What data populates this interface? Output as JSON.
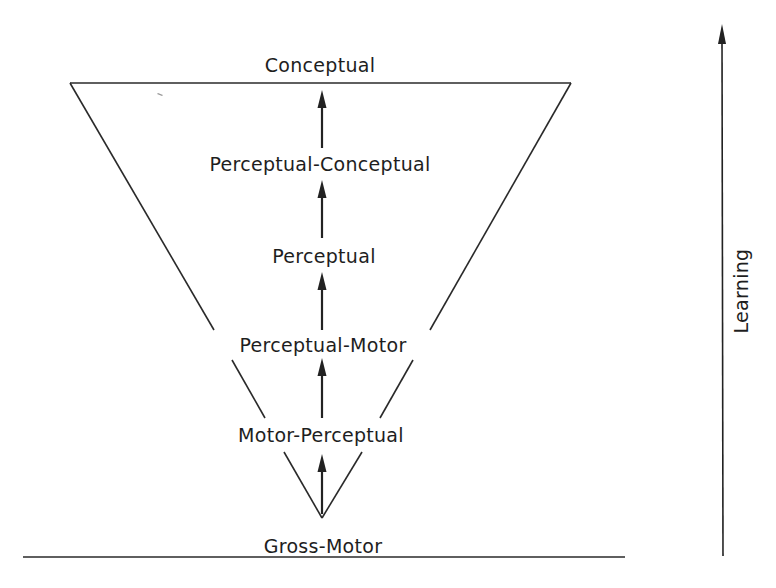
{
  "diagram": {
    "type": "inverted-triangle hierarchy",
    "stages": [
      {
        "id": "conceptual",
        "label": "Conceptual"
      },
      {
        "id": "perceptual-conceptual",
        "label": "Perceptual-Conceptual"
      },
      {
        "id": "perceptual",
        "label": "Perceptual"
      },
      {
        "id": "perceptual-motor",
        "label": "Perceptual-Motor"
      },
      {
        "id": "motor-perceptual",
        "label": "Motor-Perceptual"
      },
      {
        "id": "gross-motor",
        "label": "Gross-Motor"
      }
    ],
    "axis": {
      "label": "Learning",
      "direction": "up"
    },
    "colors": {
      "ink": "#1e1e1e",
      "background": "#ffffff"
    }
  }
}
